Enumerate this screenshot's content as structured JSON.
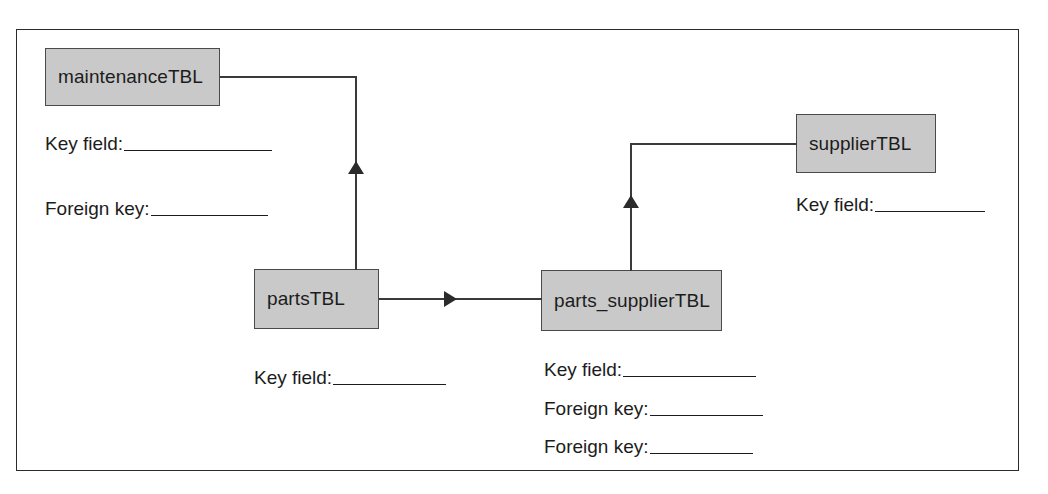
{
  "diagram": {
    "type": "entity-relationship-diagram",
    "frame": {
      "label": "diagram-frame"
    },
    "entities": [
      {
        "id": "maintenance",
        "name": "maintenanceTBL",
        "fields": [
          {
            "label": "Key field:",
            "value": ""
          },
          {
            "label": "Foreign key:",
            "value": ""
          }
        ]
      },
      {
        "id": "parts",
        "name": "partsTBL",
        "fields": [
          {
            "label": "Key field:",
            "value": ""
          }
        ]
      },
      {
        "id": "parts_supplier",
        "name": "parts_supplierTBL",
        "fields": [
          {
            "label": "Key field:",
            "value": ""
          },
          {
            "label": "Foreign key:",
            "value": ""
          },
          {
            "label": "Foreign key:",
            "value": ""
          }
        ]
      },
      {
        "id": "supplier",
        "name": "supplierTBL",
        "fields": [
          {
            "label": "Key field:",
            "value": ""
          }
        ]
      }
    ],
    "relationships": [
      {
        "from": "partsTBL",
        "to": "maintenanceTBL",
        "direction": "up"
      },
      {
        "from": "partsTBL",
        "to": "parts_supplierTBL",
        "direction": "right"
      },
      {
        "from": "parts_supplierTBL",
        "to": "supplierTBL",
        "direction": "up"
      }
    ],
    "colors": {
      "entity_fill": "#c9c9c9",
      "entity_border": "#4a4a4a",
      "connector": "#3a3a3a",
      "frame_border": "#2b2b2b",
      "text": "#1c1c1c",
      "background": "#ffffff"
    }
  }
}
